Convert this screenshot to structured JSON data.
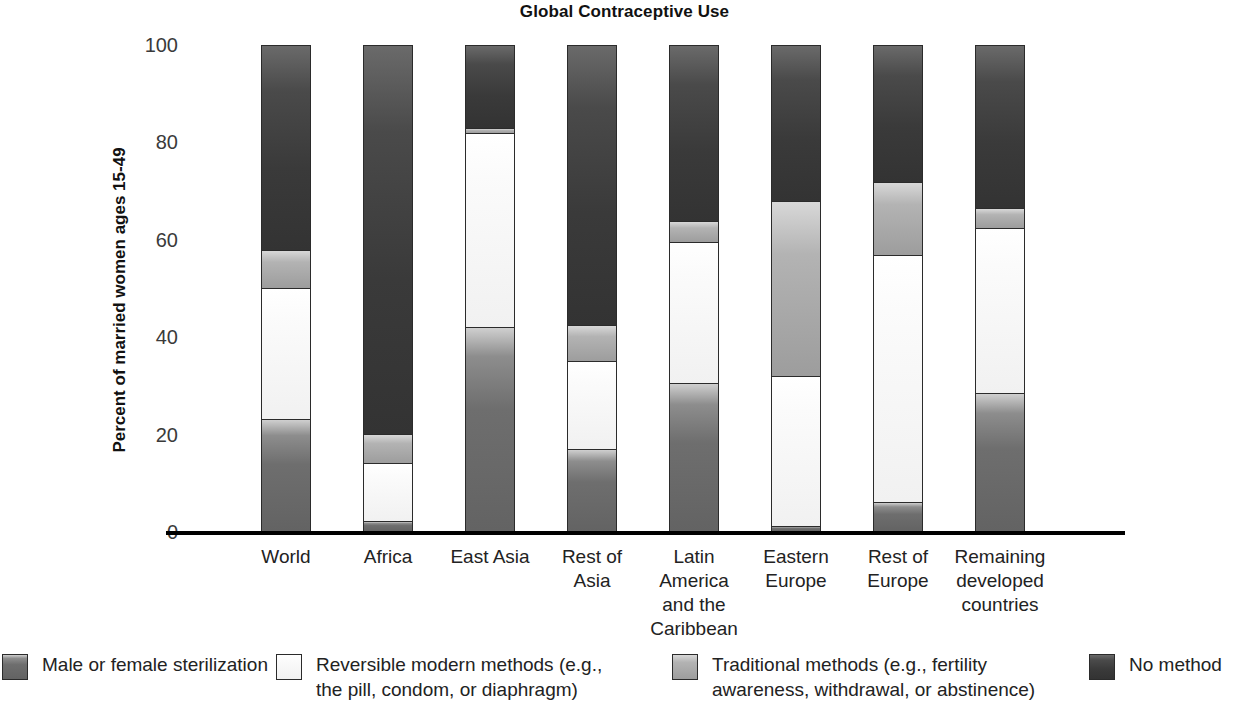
{
  "chart_data": {
    "type": "bar",
    "subtype": "stacked-bar-100",
    "title": "Global Contraceptive Use",
    "xlabel": "",
    "ylabel": "Percent of married women ages 15-49",
    "ylim": [
      0,
      100
    ],
    "yticks": [
      0,
      20,
      40,
      60,
      80,
      100
    ],
    "grid": false,
    "legend_position": "bottom",
    "categories": [
      "World",
      "Africa",
      "East Asia",
      "Rest of\nAsia",
      "Latin\nAmerica\nand the\nCaribbean",
      "Eastern\nEurope",
      "Rest of\nEurope",
      "Remaining\ndeveloped\ncountries"
    ],
    "series": [
      {
        "name": "Male or female sterilization",
        "color": "#6b6b6b",
        "values": [
          23,
          2,
          42,
          17,
          30.5,
          1,
          6,
          28.5
        ]
      },
      {
        "name": "Reversible modern methods (e.g.,\nthe pill, condom, or diaphragm)",
        "color": "#f5f5f5",
        "values": [
          27,
          12,
          40,
          18,
          29,
          31,
          51,
          34
        ]
      },
      {
        "name": "Traditional methods (e.g., fertility\nawareness, withdrawal, or abstinence)",
        "color": "#a8a8a8",
        "values": [
          8,
          6,
          1,
          7.5,
          4.5,
          36,
          15,
          4
        ]
      },
      {
        "name": "No method",
        "color": "#3b3b3b",
        "values": [
          42,
          80,
          17,
          57.5,
          36,
          32,
          28,
          33.5
        ]
      }
    ]
  },
  "legend": {
    "items": [
      {
        "label": "Male or female sterilization",
        "swatch": "sterilization"
      },
      {
        "label": "Reversible modern methods (e.g.,\nthe pill, condom, or diaphragm)",
        "swatch": "reversible"
      },
      {
        "label": "Traditional methods (e.g., fertility\nawareness, withdrawal, or abstinence)",
        "swatch": "traditional"
      },
      {
        "label": "No method",
        "swatch": "nomethod"
      }
    ]
  }
}
